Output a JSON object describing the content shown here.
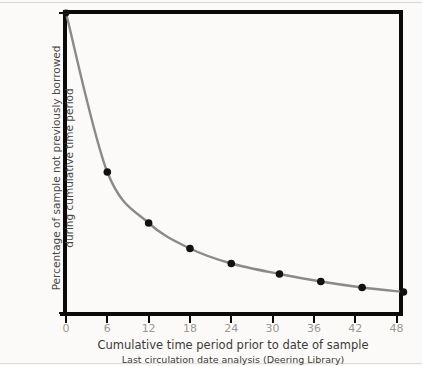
{
  "chart_data": {
    "type": "line",
    "title": "",
    "xlabel": "Cumulative time period prior to date of sample",
    "sublabel": "Last circulation date analysis (Deering Library)",
    "ylabel": "Percentage of sample not previously borrowed during cumulative time period",
    "ylabel_line1": "Percentage of sample not previously borrowed",
    "ylabel_line2": "during cumulative time period",
    "xlim": [
      0,
      48.5
    ],
    "ylim": [
      0,
      100
    ],
    "grid": false,
    "legend": false,
    "xticks": [
      0,
      6,
      12,
      18,
      24,
      30,
      36,
      42,
      48
    ],
    "xticklabels": [
      "0",
      "6",
      "12",
      "18",
      "24",
      "30",
      "36",
      "42",
      "48"
    ],
    "yticks": [
      0,
      10,
      20,
      30,
      40,
      50,
      60,
      70,
      80,
      90,
      100
    ],
    "yticklabels": [
      "0%",
      "10%",
      "20%",
      "30%",
      "40%",
      "50%",
      "60%",
      "70%",
      "80%",
      "90%",
      "100%"
    ],
    "x": [
      0,
      6,
      12,
      18,
      24,
      31,
      37,
      43,
      49
    ],
    "values": [
      100,
      47,
      30,
      21.5,
      16.5,
      13,
      10.5,
      8.5,
      7
    ],
    "series": [
      {
        "name": "Percentage of sample not previously borrowed",
        "x": [
          0,
          6,
          12,
          18,
          24,
          31,
          37,
          43,
          49
        ],
        "values": [
          100,
          47,
          30,
          21.5,
          16.5,
          13,
          10.5,
          8.5,
          7
        ]
      }
    ],
    "line_color": "#8a8a8a",
    "marker_color": "#111111",
    "axis_color": "#0a0a0a",
    "tick_label_color": "#9a9894",
    "background_color": "#fbfaf8"
  }
}
